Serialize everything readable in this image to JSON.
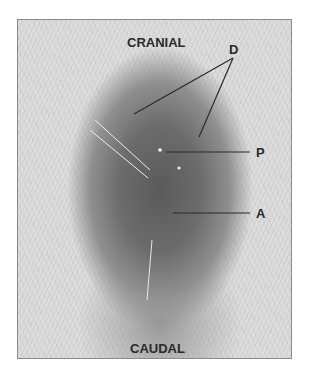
{
  "figure": {
    "labels": {
      "top": "CRANIAL",
      "bottom": "CAUDAL",
      "d": "D",
      "p": "P",
      "a": "A"
    },
    "colors": {
      "background": "#ffffff",
      "frame_border": "#8a8a8a",
      "label_text": "#2a2a2a",
      "leader_lines": "#2a2a2a"
    }
  }
}
